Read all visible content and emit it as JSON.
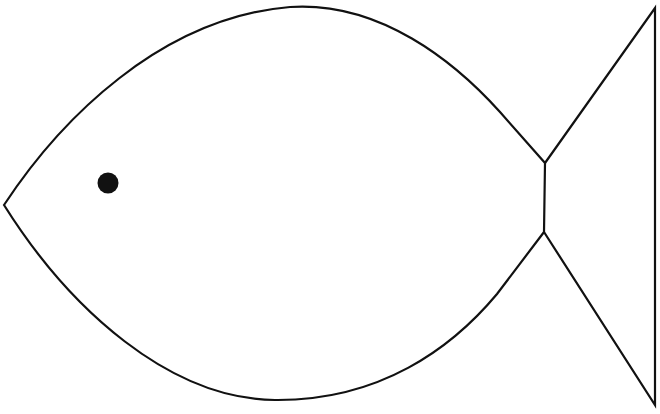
{
  "document": {
    "title": "Fish Outline Drawing",
    "kind": "line-art-illustration",
    "subject": "fish",
    "width": 660,
    "height": 414
  },
  "canvas": {
    "background_color": "#ffffff",
    "stroke_color": "#111111",
    "fill_color": "none",
    "stroke_width": 2.2
  },
  "shapes": {
    "body": {
      "name": "fish-body-outline",
      "fill": "none",
      "stroke": "#111111",
      "stroke_width": 2.2,
      "path": "M 4 205 C 60 120, 160 18, 290 7 C 380 1, 455 62, 500 112 L 545 163 L 544 232 L 497 294 C 452 348, 380 401, 275 400 C 170 399, 70 310, 4 205 Z"
    },
    "tail": {
      "name": "fish-tail-fin",
      "fill": "none",
      "stroke": "#111111",
      "stroke_width": 2.2,
      "path": "M 545 163 L 655 8 L 655 405 L 544 232"
    },
    "eye": {
      "name": "fish-eye",
      "fill": "#111111",
      "stroke": "none",
      "cx": 108,
      "cy": 183,
      "r": 10.5
    }
  },
  "geometry_points": {
    "mouth_tip": [
      4,
      205
    ],
    "body_top_apex": [
      290,
      7
    ],
    "body_bottom_apex": [
      275,
      400
    ],
    "tail_notch_upper": [
      545,
      163
    ],
    "tail_notch_lower": [
      544,
      232
    ],
    "tail_corner_top_right": [
      655,
      8
    ],
    "tail_corner_bottom_right": [
      655,
      405
    ]
  }
}
